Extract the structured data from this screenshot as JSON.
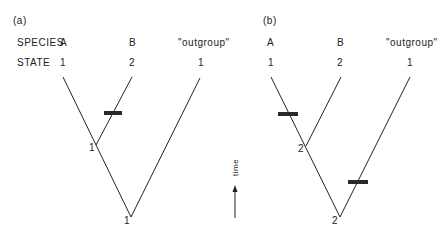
{
  "panels": [
    {
      "id": "a",
      "label": "(a)",
      "row_labels": {
        "species": "SPECIES",
        "state": "STATE"
      },
      "taxa": [
        {
          "name": "A",
          "state": "1"
        },
        {
          "name": "B",
          "state": "2"
        },
        {
          "name": "\"outgroup\"",
          "state": "1"
        }
      ],
      "internal_node_state": "1",
      "root_state": "1",
      "changes": [
        {
          "branch": "B",
          "note": "1→2"
        }
      ]
    },
    {
      "id": "b",
      "label": "(b)",
      "taxa": [
        {
          "name": "A",
          "state": "1"
        },
        {
          "name": "B",
          "state": "2"
        },
        {
          "name": "\"outgroup\"",
          "state": "1"
        }
      ],
      "internal_node_state": "2",
      "root_state": "2",
      "changes": [
        {
          "branch": "A",
          "note": "2→1"
        },
        {
          "branch": "outgroup",
          "note": "2→1"
        }
      ]
    }
  ],
  "time_axis": {
    "label": "time"
  },
  "colors": {
    "ink": "#222222",
    "bar": "#2a2a2a",
    "background": "#ffffff"
  }
}
